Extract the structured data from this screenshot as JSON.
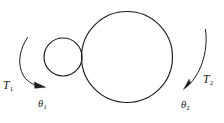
{
  "figure": {
    "background_color": "#ffffff",
    "stroke_color": "#1b1b1b",
    "width": 224,
    "height": 123,
    "labels": {
      "torque_left": {
        "symbol": "T",
        "subscript": "1",
        "full": "T1"
      },
      "torque_right": {
        "symbol": "T",
        "subscript": "2",
        "full": "T2"
      },
      "angle_left": {
        "symbol": "θ",
        "subscript": "1",
        "full": "θ1"
      },
      "angle_right": {
        "symbol": "θ",
        "subscript": "2",
        "full": "θ2"
      }
    },
    "shapes": {
      "small_disc": {
        "name": "small-disc",
        "center_x": 63,
        "center_y": 57,
        "radius": 19
      },
      "large_disc": {
        "name": "large-disc",
        "center_x": 127,
        "center_y": 57,
        "radius": 45
      }
    },
    "arrows": {
      "left_torque_arc": {
        "direction": "clockwise",
        "arrowhead_at": "lower-right"
      },
      "right_torque_arc": {
        "direction": "counter-clockwise",
        "arrowhead_at": "lower-left"
      }
    }
  }
}
